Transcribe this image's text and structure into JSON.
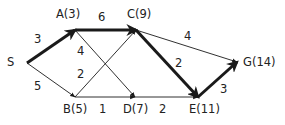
{
  "colors": {
    "stroke": "#1a1a1a",
    "text": "#222222",
    "background": "#ffffff"
  },
  "nodes": [
    {
      "id": "S",
      "label": "S",
      "x": 27,
      "y": 63,
      "lx": 7,
      "ly": 57
    },
    {
      "id": "A",
      "label": "A(3)",
      "x": 75,
      "y": 30,
      "lx": 56,
      "ly": 9
    },
    {
      "id": "C",
      "label": "C(9)",
      "x": 136,
      "y": 30,
      "lx": 127,
      "ly": 9
    },
    {
      "id": "B",
      "label": "B(5)",
      "x": 75,
      "y": 97,
      "lx": 63,
      "ly": 104
    },
    {
      "id": "D",
      "label": "D(7)",
      "x": 135,
      "y": 97,
      "lx": 123,
      "ly": 104
    },
    {
      "id": "E",
      "label": "E(11)",
      "x": 198,
      "y": 97,
      "lx": 189,
      "ly": 104
    },
    {
      "id": "G",
      "label": "G(14)",
      "x": 237,
      "y": 62,
      "lx": 243,
      "ly": 57
    }
  ],
  "edges": [
    {
      "from": "S",
      "to": "A",
      "weight": "3",
      "bold": true,
      "wx": 34,
      "wy": 34
    },
    {
      "from": "S",
      "to": "B",
      "weight": "5",
      "bold": false,
      "wx": 34,
      "wy": 81
    },
    {
      "from": "A",
      "to": "C",
      "weight": "6",
      "bold": true,
      "wx": 98,
      "wy": 12
    },
    {
      "from": "A",
      "to": "D",
      "weight": "4",
      "bold": false,
      "wx": 77,
      "wy": 46
    },
    {
      "from": "B",
      "to": "C",
      "weight": "2",
      "bold": false,
      "wx": 77,
      "wy": 69
    },
    {
      "from": "B",
      "to": "D",
      "weight": "1",
      "bold": false,
      "wx": 99,
      "wy": 104
    },
    {
      "from": "C",
      "to": "E",
      "weight": "2",
      "bold": true,
      "wx": 175,
      "wy": 58
    },
    {
      "from": "C",
      "to": "G",
      "weight": "4",
      "bold": false,
      "wx": 184,
      "wy": 31
    },
    {
      "from": "D",
      "to": "E",
      "weight": "2",
      "bold": false,
      "wx": 159,
      "wy": 104
    },
    {
      "from": "E",
      "to": "G",
      "weight": "3",
      "bold": true,
      "wx": 220,
      "wy": 84
    }
  ]
}
